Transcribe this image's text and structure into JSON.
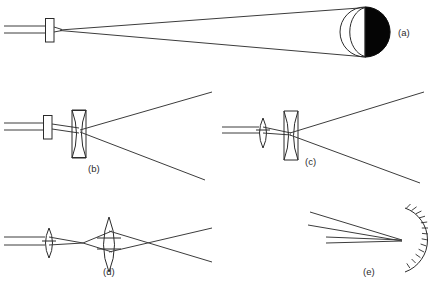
{
  "figure": {
    "background_color": "#ffffff",
    "line_color": "#3c3c3c",
    "outline_color": "#2b2b2b",
    "fill_color": "#050505",
    "width": 428,
    "height": 285
  },
  "panels": [
    {
      "id": "a",
      "label": "(a)",
      "label_x": 398,
      "label_y": 32,
      "description": "collimated beam through a slab aperture expanding onto a half-illuminated spherical body",
      "elements": [
        {
          "name": "incoming-beam",
          "type": "parallel-rays",
          "count": 2
        },
        {
          "name": "slab-aperture",
          "type": "rectangle",
          "x": 45,
          "y": 18,
          "width": 9,
          "height": 24
        },
        {
          "name": "diverging-cone",
          "type": "ray-cone"
        },
        {
          "name": "spherical-body",
          "type": "circle",
          "cx": 365,
          "cy": 32,
          "r": 25
        },
        {
          "name": "terminator-arc",
          "type": "arc"
        },
        {
          "name": "illuminated-half",
          "type": "half-disc-fill",
          "side": "right"
        }
      ]
    },
    {
      "id": "b",
      "label": "(b)",
      "label_x": 88,
      "label_y": 172,
      "description": "collimated beam through a slab aperture then a biconcave diverging lens",
      "elements": [
        {
          "name": "incoming-beam",
          "type": "parallel-rays",
          "count": 2
        },
        {
          "name": "slab-aperture",
          "type": "rectangle",
          "x": 43,
          "y": 115,
          "width": 9,
          "height": 24
        },
        {
          "name": "concave-lens",
          "type": "biconcave-lens",
          "cx": 79,
          "top": 110,
          "bottom": 158
        },
        {
          "name": "diverging-rays",
          "type": "ray-fan",
          "count": 2
        }
      ]
    },
    {
      "id": "c",
      "label": "(c)",
      "label_x": 305,
      "label_y": 164,
      "description": "collimated beam focused by a convex lens then expanded by a biconcave diverging lens",
      "elements": [
        {
          "name": "incoming-beam",
          "type": "parallel-rays",
          "count": 2
        },
        {
          "name": "convex-lens",
          "type": "biconvex-lens",
          "cx": 263,
          "top": 118,
          "bottom": 148
        },
        {
          "name": "concave-lens",
          "type": "biconcave-lens",
          "cx": 291,
          "top": 111,
          "bottom": 160
        },
        {
          "name": "diverging-rays",
          "type": "ray-fan",
          "count": 2
        }
      ]
    },
    {
      "id": "d",
      "label": "(d)",
      "label_x": 103,
      "label_y": 274,
      "description": "collimated beam focused by a small convex lens then recollimated and crossed by a large convex lens",
      "elements": [
        {
          "name": "incoming-beam",
          "type": "parallel-rays",
          "count": 2
        },
        {
          "name": "small-convex-lens",
          "type": "biconvex-lens",
          "cx": 49,
          "top": 228,
          "bottom": 258
        },
        {
          "name": "large-convex-lens",
          "type": "biconvex-lens",
          "cx": 109,
          "top": 217,
          "bottom": 272
        },
        {
          "name": "crossing-rays",
          "type": "ray-cross",
          "count": 2
        }
      ]
    },
    {
      "id": "e",
      "label": "(e)",
      "label_x": 363,
      "label_y": 274,
      "description": "beam reflected from a concave mirror drawn with hatching on its rear surface",
      "elements": [
        {
          "name": "incoming-beam",
          "type": "parallel-rays",
          "count": 2
        },
        {
          "name": "reflected-rays",
          "type": "ray-fan",
          "count": 2
        },
        {
          "name": "concave-mirror",
          "type": "mirror-arc",
          "cx": 404,
          "cy": 240,
          "r": 34
        },
        {
          "name": "mirror-hatching",
          "type": "hatch-marks",
          "count": 13
        }
      ]
    }
  ]
}
